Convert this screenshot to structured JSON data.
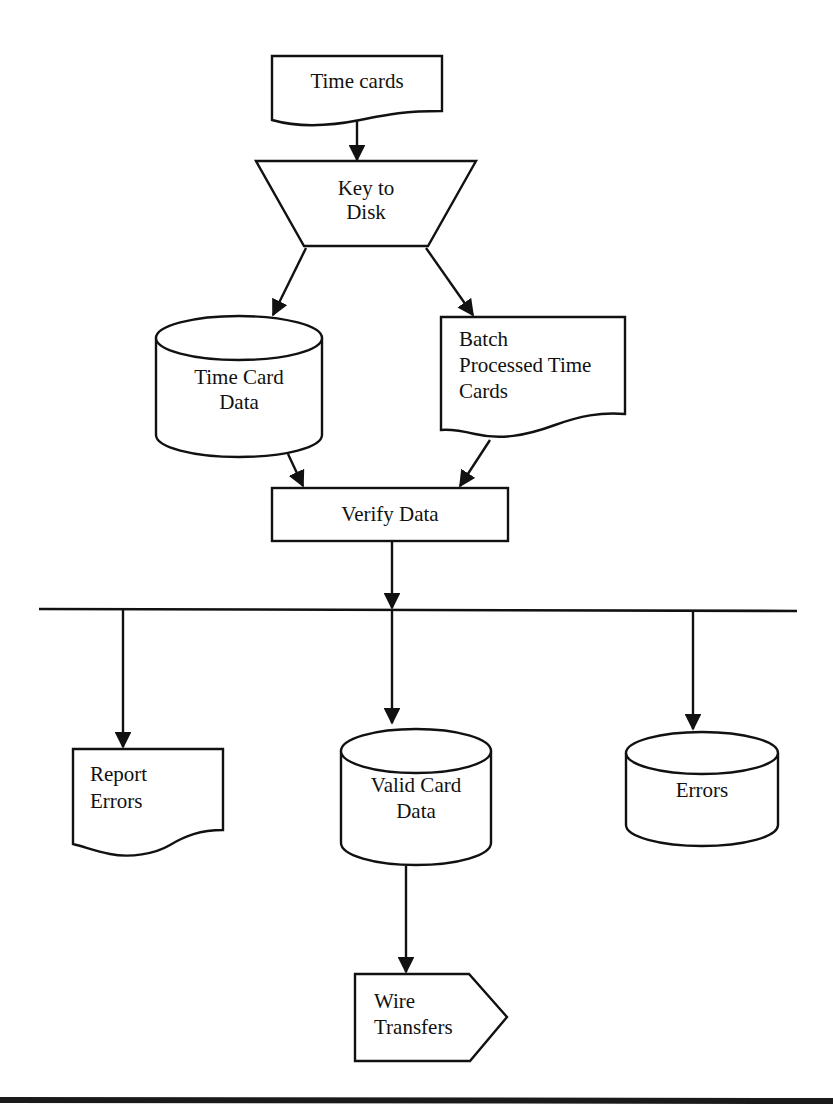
{
  "diagram": {
    "type": "flowchart",
    "nodes": {
      "time_cards": {
        "shape": "document",
        "lines": [
          "Time cards"
        ]
      },
      "key_to_disk": {
        "shape": "manual-operation",
        "lines": [
          "Key to",
          "Disk"
        ]
      },
      "time_card_data": {
        "shape": "disk-storage",
        "lines": [
          "Time Card",
          "Data"
        ]
      },
      "batch_processed": {
        "shape": "document",
        "lines": [
          "Batch",
          "Processed Time",
          "Cards"
        ]
      },
      "verify_data": {
        "shape": "process",
        "lines": [
          "Verify Data"
        ]
      },
      "report_errors": {
        "shape": "document",
        "lines": [
          "Report",
          "Errors"
        ]
      },
      "valid_card_data": {
        "shape": "disk-storage",
        "lines": [
          "Valid Card",
          "Data"
        ]
      },
      "errors": {
        "shape": "disk-storage",
        "lines": [
          "Errors"
        ]
      },
      "wire_transfers": {
        "shape": "off-page-connector",
        "lines": [
          "Wire",
          "Transfers"
        ]
      }
    },
    "edges": [
      {
        "from": "Time cards",
        "to": "Key to Disk"
      },
      {
        "from": "Key to Disk",
        "to": "Time Card Data"
      },
      {
        "from": "Key to Disk",
        "to": "Batch Processed Time Cards"
      },
      {
        "from": "Time Card Data",
        "to": "Verify Data"
      },
      {
        "from": "Batch Processed Time Cards",
        "to": "Verify Data"
      },
      {
        "from": "Verify Data",
        "to": "Report Errors"
      },
      {
        "from": "Verify Data",
        "to": "Valid Card Data"
      },
      {
        "from": "Verify Data",
        "to": "Errors"
      },
      {
        "from": "Valid Card Data",
        "to": "Wire Transfers"
      }
    ],
    "colors": {
      "stroke": "#111111",
      "background": "#ffffff"
    }
  }
}
